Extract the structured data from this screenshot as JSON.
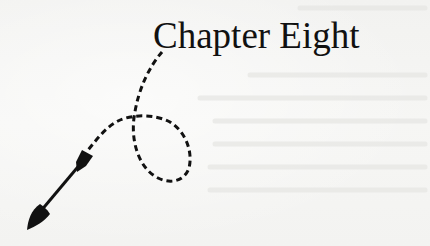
{
  "page": {
    "chapter_title": "Chapter Eight",
    "colors": {
      "paper": "#f4f4f2",
      "ink": "#111111"
    },
    "ornament": {
      "description": "dashed looping line ending in an arrow pointing down-left",
      "icon": "dashed-arrow-icon"
    }
  }
}
